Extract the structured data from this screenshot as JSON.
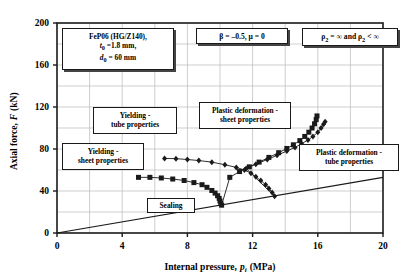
{
  "chart_data": {
    "type": "line",
    "title": "",
    "xlabel": "Internal pressure, p_i (MPa)",
    "ylabel": "Axial force, F (kN)",
    "xlim": [
      0,
      20
    ],
    "ylim": [
      0,
      200
    ],
    "xticks": [
      0,
      4,
      8,
      12,
      16,
      20
    ],
    "yticks": [
      0,
      40,
      80,
      120,
      160,
      200
    ],
    "grid": true,
    "grid_x_step": 2,
    "grid_y_step": 20,
    "legend": "none",
    "series": [
      {
        "name": "Yielding / plastic deformation - sheet properties (squares)",
        "marker": "square",
        "color": "#1a1a1a",
        "points": [
          [
            5.0,
            53.0
          ],
          [
            5.7,
            53.0
          ],
          [
            6.4,
            52.4
          ],
          [
            7.1,
            51.4
          ],
          [
            7.8,
            50.0
          ],
          [
            8.4,
            48.0
          ],
          [
            8.9,
            46.0
          ],
          [
            9.2,
            43.5
          ],
          [
            9.5,
            40.5
          ],
          [
            9.7,
            38.0
          ],
          [
            9.85,
            35.5
          ],
          [
            9.95,
            33.0
          ],
          [
            10.0,
            30.5
          ],
          [
            10.05,
            28.0
          ],
          [
            10.1,
            26.5
          ],
          [
            10.6,
            53.0
          ],
          [
            11.2,
            58.5
          ],
          [
            11.8,
            63.0
          ],
          [
            12.4,
            67.5
          ],
          [
            13.0,
            72.0
          ],
          [
            13.6,
            76.5
          ],
          [
            14.1,
            80.5
          ],
          [
            14.5,
            84.0
          ],
          [
            14.9,
            88.0
          ],
          [
            15.2,
            92.0
          ],
          [
            15.45,
            96.0
          ],
          [
            15.65,
            100.0
          ],
          [
            15.8,
            104.0
          ],
          [
            15.9,
            108.0
          ],
          [
            15.95,
            111.5
          ]
        ]
      },
      {
        "name": "Yielding / plastic deformation - tube properties (diamonds)",
        "marker": "diamond",
        "color": "#1a1a1a",
        "points": [
          [
            6.6,
            71.0
          ],
          [
            7.3,
            70.8
          ],
          [
            8.0,
            70.0
          ],
          [
            8.7,
            69.0
          ],
          [
            9.5,
            67.5
          ],
          [
            10.3,
            65.0
          ],
          [
            11.0,
            62.5
          ],
          [
            11.5,
            60.0
          ],
          [
            11.9,
            57.0
          ],
          [
            12.2,
            53.5
          ],
          [
            12.5,
            50.0
          ],
          [
            12.8,
            46.0
          ],
          [
            13.0,
            42.5
          ],
          [
            13.2,
            38.5
          ],
          [
            13.35,
            35.0
          ],
          [
            11.6,
            61.5
          ],
          [
            12.2,
            65.5
          ],
          [
            12.9,
            70.0
          ],
          [
            13.5,
            74.0
          ],
          [
            14.1,
            78.0
          ],
          [
            14.6,
            81.5
          ],
          [
            15.0,
            85.0
          ],
          [
            15.4,
            88.5
          ],
          [
            15.7,
            92.0
          ],
          [
            16.0,
            96.0
          ],
          [
            16.2,
            100.0
          ],
          [
            16.35,
            103.5
          ],
          [
            16.45,
            106.0
          ]
        ]
      },
      {
        "name": "Sealing",
        "marker": "none",
        "color": "#1a1a1a",
        "points": [
          [
            0.0,
            0.0
          ],
          [
            20.0,
            53.0
          ]
        ]
      }
    ],
    "annotations": [
      {
        "name": "material-conditions",
        "lines": [
          "FeP06 (HG/Z140),",
          "t₀ =1.8 mm,",
          "d₀ = 60 mm"
        ]
      },
      {
        "name": "beta-mu-conditions",
        "lines": [
          "β = –0.5, μ = 0"
        ]
      },
      {
        "name": "rho-conditions",
        "lines": [
          "ρ₂ = ∞ and ρ₂ < ∞"
        ]
      },
      {
        "name": "yielding-tube",
        "lines": [
          "Yielding -",
          "tube properties"
        ]
      },
      {
        "name": "yielding-sheet",
        "lines": [
          "Yielding -",
          "sheet properties"
        ]
      },
      {
        "name": "plastic-sheet",
        "lines": [
          "Plastic deformation -",
          "sheet properties"
        ]
      },
      {
        "name": "plastic-tube",
        "lines": [
          "Plastic deformation -",
          "tube properties"
        ]
      },
      {
        "name": "sealing",
        "lines": [
          "Sealing"
        ]
      }
    ]
  },
  "axes": {
    "x": {
      "title_main": "Internal pressure,",
      "title_sym": "p",
      "title_sub": "i",
      "title_unit": "(MPa)",
      "tick_labels": [
        "0",
        "4",
        "8",
        "12",
        "16",
        "20"
      ]
    },
    "y": {
      "title_main": "Axial force,",
      "title_sym": "F",
      "title_unit": "(kN)",
      "tick_labels": [
        "0",
        "40",
        "80",
        "120",
        "160",
        "200"
      ]
    }
  },
  "annotations": {
    "material": {
      "line1": "FeP06 (HG/Z140),",
      "line2_sym": "t",
      "line2_sub": "0",
      "line2_val": "=1.8 mm,",
      "line3_sym": "d",
      "line3_sub": "0",
      "line3_val": "= 60 mm"
    },
    "beta": {
      "text": "β = –0.5, μ = 0"
    },
    "rho": {
      "sym1": "ρ",
      "sub1": "2",
      "mid": " = ∞ and ",
      "sym2": "ρ",
      "sub2": "2",
      "end": " < ∞"
    },
    "yield_tube": {
      "line1": "Yielding -",
      "line2": "tube properties"
    },
    "yield_sheet": {
      "line1": "Yielding -",
      "line2": "sheet properties"
    },
    "plastic_sheet": {
      "line1": "Plastic deformation -",
      "line2": "sheet properties"
    },
    "plastic_tube": {
      "line1": "Plastic deformation -",
      "line2": "tube properties"
    },
    "sealing": {
      "line1": "Sealing"
    }
  },
  "style": {
    "axis_color": "#1a1a1a",
    "grid_color": "#b9b9b9",
    "series_color": "#1a1a1a",
    "background": "#ffffff"
  }
}
